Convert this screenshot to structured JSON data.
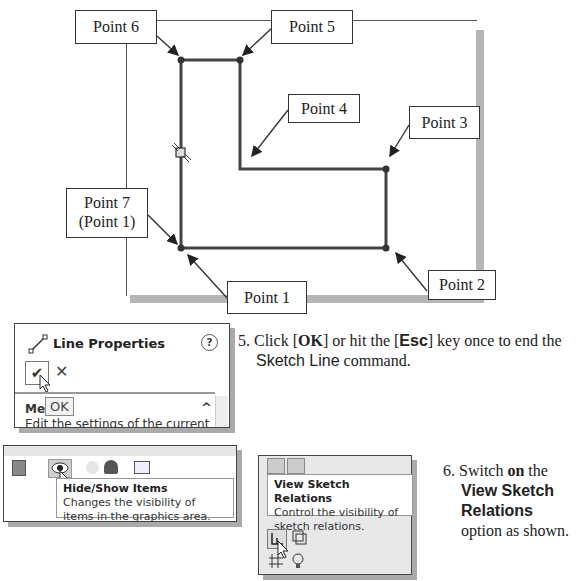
{
  "figure": {
    "callouts": {
      "p6": "Point 6",
      "p5": "Point 5",
      "p4": "Point 4",
      "p3": "Point 3",
      "p7_line1": "Point 7",
      "p7_line2": "(Point 1)",
      "p2": "Point 2",
      "p1": "Point 1"
    }
  },
  "line_properties_panel": {
    "title": "Line Properties",
    "help_icon": "?",
    "ok_icon": "✔",
    "cancel_icon": "✕",
    "section_label": "Me",
    "ok_tooltip": "OK",
    "collapse_icon": "^",
    "description": "Edit the settings of the current"
  },
  "step5": {
    "number": "5.",
    "text_a": "Click [",
    "ok": "OK",
    "text_b": "] or hit the [",
    "esc": "Esc",
    "text_c": "] key once to end the",
    "command": "Sketch Line",
    "text_d": " command."
  },
  "view_toolbar": {
    "tooltip_title": "Hide/Show Items",
    "tooltip_body": "Changes the visibility of items in the graphics area."
  },
  "sketch_relations_panel": {
    "tooltip_title": "View Sketch Relations",
    "tooltip_body": "Control the visibility of sketch relations."
  },
  "step6": {
    "number": "6.",
    "text_a": "Switch ",
    "on": "on",
    "text_b": " the",
    "option1": "View Sketch",
    "option2": "Relations",
    "text_c": "option as shown."
  }
}
